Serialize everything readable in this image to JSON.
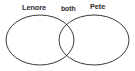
{
  "figure": {
    "type": "venn-diagram",
    "background_color": "#ffffff",
    "stroke_color": "#3a3a3a",
    "text_color": "#2e2e2e",
    "labels": {
      "left": "Lenore",
      "overlap": "both",
      "right": "Pete"
    }
  },
  "chart_data": {
    "type": "diagram",
    "diagram_type": "venn",
    "title": "",
    "sets": [
      {
        "name": "Lenore",
        "label": "Lenore",
        "shape": "ellipse",
        "cx": 40,
        "cy": 40,
        "rx": 34,
        "ry": 25,
        "label_x": 36,
        "label_y": 8
      },
      {
        "name": "Pete",
        "label": "Pete",
        "shape": "ellipse",
        "cx": 94,
        "cy": 40,
        "rx": 35,
        "ry": 25,
        "label_x": 99,
        "label_y": 7
      }
    ],
    "intersection": {
      "label": "both",
      "label_x": 69,
      "label_y": 9
    },
    "stroke_color": "#3a3a3a",
    "stroke_width": 1,
    "fill": "none",
    "background": "#ffffff",
    "grid": false,
    "legend": "none"
  }
}
